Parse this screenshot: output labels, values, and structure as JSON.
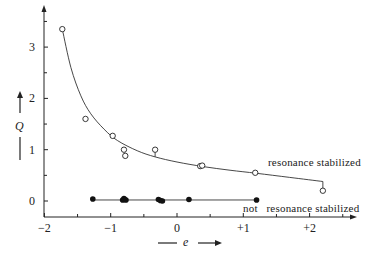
{
  "chart_data": {
    "type": "scatter",
    "title": "",
    "xlabel": "e",
    "ylabel": "Q",
    "xlim": [
      -2,
      2.7
    ],
    "ylim": [
      -0.3,
      3.8
    ],
    "x_ticks": [
      -2,
      -1,
      0,
      1,
      2
    ],
    "x_tick_labels": [
      "−2",
      "−1",
      "0",
      "+1",
      "+2"
    ],
    "x_minor_ticks": [
      -1.5,
      -0.5,
      0.5,
      1.5,
      2.5
    ],
    "y_ticks": [
      0,
      1,
      2,
      3
    ],
    "y_tick_labels": [
      "0",
      "1",
      "2",
      "3"
    ],
    "y_minor_ticks": [
      0.5,
      1.5,
      2.5,
      3.5
    ],
    "grid": false,
    "legend": null,
    "series": [
      {
        "name": "resonance stabilized",
        "marker": "open-circle",
        "fit": "hyperbolic curve",
        "points": [
          {
            "e": -1.73,
            "Q": 3.35
          },
          {
            "e": -1.38,
            "Q": 1.6
          },
          {
            "e": -0.97,
            "Q": 1.27
          },
          {
            "e": -0.8,
            "Q": 1.0
          },
          {
            "e": -0.78,
            "Q": 0.88
          },
          {
            "e": -0.33,
            "Q": 1.0
          },
          {
            "e": 0.35,
            "Q": 0.68
          },
          {
            "e": 0.38,
            "Q": 0.69
          },
          {
            "e": 1.18,
            "Q": 0.55
          },
          {
            "e": 2.2,
            "Q": 0.2
          }
        ],
        "curve": [
          {
            "e": -1.73,
            "Q": 3.35
          },
          {
            "e": -1.6,
            "Q": 2.6
          },
          {
            "e": -1.45,
            "Q": 2.05
          },
          {
            "e": -1.3,
            "Q": 1.7
          },
          {
            "e": -1.1,
            "Q": 1.4
          },
          {
            "e": -0.9,
            "Q": 1.18
          },
          {
            "e": -0.6,
            "Q": 0.98
          },
          {
            "e": -0.33,
            "Q": 0.86
          },
          {
            "e": 0.0,
            "Q": 0.76
          },
          {
            "e": 0.4,
            "Q": 0.67
          },
          {
            "e": 0.8,
            "Q": 0.6
          },
          {
            "e": 1.2,
            "Q": 0.54
          },
          {
            "e": 1.7,
            "Q": 0.46
          },
          {
            "e": 2.2,
            "Q": 0.38
          }
        ]
      },
      {
        "name": "not resonance stabilized",
        "marker": "filled-circle",
        "fit": "horizontal line at Q≈0.03",
        "points": [
          {
            "e": -1.27,
            "Q": 0.04
          },
          {
            "e": -0.82,
            "Q": 0.02
          },
          {
            "e": -0.8,
            "Q": 0.05
          },
          {
            "e": -0.79,
            "Q": 0.03
          },
          {
            "e": -0.77,
            "Q": 0.02
          },
          {
            "e": -0.28,
            "Q": 0.03
          },
          {
            "e": -0.25,
            "Q": 0.01
          },
          {
            "e": -0.22,
            "Q": 0.0
          },
          {
            "e": 0.18,
            "Q": 0.03
          },
          {
            "e": 1.2,
            "Q": 0.02
          }
        ],
        "line": [
          {
            "e": -1.27,
            "Q": 0.02
          },
          {
            "e": 1.2,
            "Q": 0.02
          }
        ]
      }
    ],
    "annotations": [
      {
        "text": "resonance stabilized",
        "near": {
          "e": 1.8,
          "Q": 0.68
        }
      },
      {
        "text": "not   resonance stabilized",
        "near": {
          "e": 1.9,
          "Q": -0.16
        }
      }
    ]
  },
  "labels": {
    "resonance": "resonance stabilized",
    "not_resonance": "not   resonance stabilized",
    "x_var": "e",
    "y_var": "Q"
  }
}
